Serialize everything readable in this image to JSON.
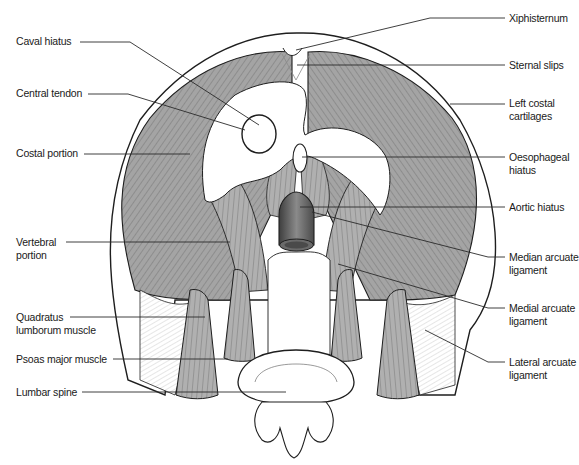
{
  "figure": {
    "colors": {
      "muscle": "#9a9a9a",
      "muscle_light": "#c4c4c4",
      "tendon": "#ffffff",
      "outline": "#1e1e1e",
      "leader_line": "#2a2a2a",
      "aorta": "#6a6a6a"
    }
  },
  "labels": {
    "left": [
      {
        "text": "Caval hiatus",
        "y": 41
      },
      {
        "text": "Central tendon",
        "y": 92
      },
      {
        "text": "Costal portion",
        "y": 150
      },
      {
        "text": "Vertebral\nportion",
        "line1": "Vertebral",
        "line2": "portion",
        "y": 237
      },
      {
        "text": "Quadratus\nlumborum muscle",
        "line1": "Quadratus",
        "line2": "lumborum muscle",
        "y": 312
      },
      {
        "text": "Psoas major muscle",
        "y": 355
      },
      {
        "text": "Lumbar spine",
        "y": 387
      }
    ],
    "right": [
      {
        "text": "Xiphisternum",
        "y": 14
      },
      {
        "text": "Sternal slips",
        "y": 60
      },
      {
        "text": "Left costal\ncartilages",
        "line1": "Left costal",
        "line2": "cartilages",
        "y": 98
      },
      {
        "text": "Oesophageal\nhiatus",
        "line1": "Oesophageal",
        "line2": "hiatus",
        "y": 152
      },
      {
        "text": "Aortic hiatus",
        "y": 201
      },
      {
        "text": "Median arcuate\nligament",
        "line1": "Median arcuate",
        "line2": "ligament",
        "y": 252
      },
      {
        "text": "Medial arcuate\nligament",
        "line1": "Medial arcuate",
        "line2": "ligament",
        "y": 304
      },
      {
        "text": "Lateral arcuate\nligament",
        "line1": "Lateral arcuate",
        "line2": "ligament",
        "y": 357
      }
    ]
  }
}
